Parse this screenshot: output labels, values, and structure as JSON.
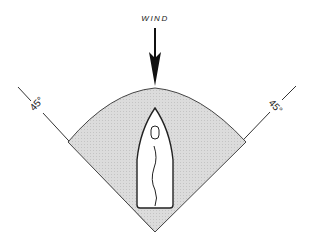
{
  "diagram": {
    "wind_label": "WIND",
    "left_angle_label": "45°",
    "right_angle_label": "45°",
    "colors": {
      "background": "#ffffff",
      "sector_fill": "#d6d6d6",
      "line": "#333333",
      "boat_fill": "#ffffff"
    }
  }
}
